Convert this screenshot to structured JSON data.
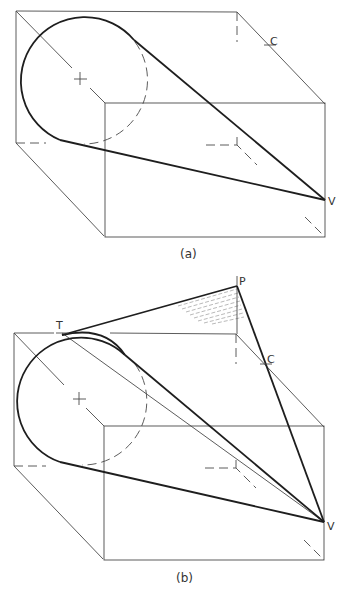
{
  "figure_a": {
    "caption": "(a)",
    "labels": {
      "c": "C",
      "v": "V"
    }
  },
  "figure_b": {
    "caption": "(b)",
    "labels": {
      "t": "T",
      "p": "P",
      "c": "C",
      "v": "V"
    }
  },
  "colors": {
    "line": "#1e1e1e",
    "thin_line": "#4a4a4a",
    "background": "#ffffff"
  }
}
